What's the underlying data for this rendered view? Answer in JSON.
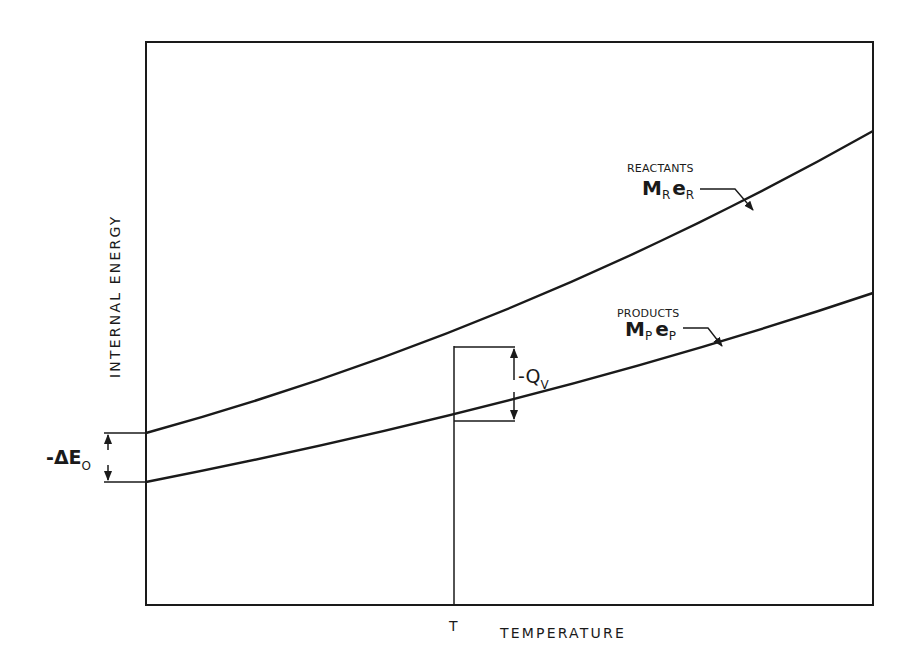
{
  "diagram": {
    "type": "energy-temperature diagram",
    "x_axis": {
      "label": "TEMPERATURE",
      "marker": "T"
    },
    "y_axis": {
      "label": "INTERNAL ENERGY"
    },
    "curves": [
      {
        "id": "reactants",
        "name": "REACTANTS",
        "symbol_main": "M",
        "symbol_sub": "R",
        "symbol_main2": "e",
        "symbol_sub2": "R"
      },
      {
        "id": "products",
        "name": "PRODUCTS",
        "symbol_main": "M",
        "symbol_sub": "P",
        "symbol_main2": "e",
        "symbol_sub2": "P"
      }
    ],
    "annotations": {
      "qv": {
        "prefix": "-Q",
        "sub": "V"
      },
      "de0": {
        "prefix": "-ΔE",
        "sub": "O"
      }
    },
    "colors": {
      "ink": "#1a1a1a",
      "background": "#ffffff"
    }
  }
}
